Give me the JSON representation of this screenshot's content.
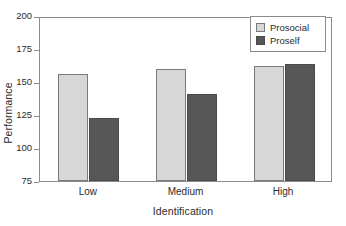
{
  "chart_data": {
    "type": "bar",
    "title": "",
    "xlabel": "Identification",
    "ylabel": "Performance",
    "categories": [
      "Low",
      "Medium",
      "High"
    ],
    "series": [
      {
        "name": "Prosocial",
        "color": "#d7d7d7",
        "values": [
          156,
          160,
          162
        ]
      },
      {
        "name": "Proself",
        "color": "#575757",
        "values": [
          123,
          141,
          164
        ]
      }
    ],
    "ylim": [
      75,
      200
    ],
    "yticks": [
      75,
      100,
      125,
      150,
      175,
      200
    ],
    "ytick_labels": [
      "75",
      "100",
      "125",
      "150",
      "175",
      "200"
    ],
    "grid": false,
    "legend_position": "top-right",
    "frame_color": "#8c8c8c",
    "background": "#ffffff"
  },
  "legend": {
    "entries": [
      {
        "label": "Prosocial",
        "swatch": "light"
      },
      {
        "label": "Proself",
        "swatch": "dark"
      }
    ]
  }
}
